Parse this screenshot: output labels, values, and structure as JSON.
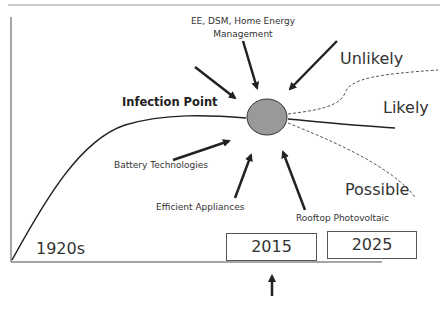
{
  "diagram": {
    "labels": {
      "top_driver_line1": "EE, DSM, Home Energy",
      "top_driver_line2": "Management",
      "inflection": "Infection Point",
      "battery": "Battery Technologies",
      "appliances": "Efficient Appliances",
      "rooftop_pv": "Rooftop Photovoltaic",
      "unlikely": "Unlikely",
      "likely": "Likely",
      "possible": "Possible",
      "start_era": "1920s"
    },
    "years": [
      {
        "label": "2015",
        "highlighted": true
      },
      {
        "label": "2025",
        "highlighted": false
      }
    ],
    "scenarios": [
      {
        "name": "Unlikely",
        "style": "dashed",
        "direction": "up"
      },
      {
        "name": "Likely",
        "style": "solid",
        "direction": "flat-down"
      },
      {
        "name": "Possible",
        "style": "dashed",
        "direction": "down"
      }
    ],
    "colors": {
      "curve": "#222222",
      "node_fill": "#999999",
      "axis": "#888888"
    }
  }
}
